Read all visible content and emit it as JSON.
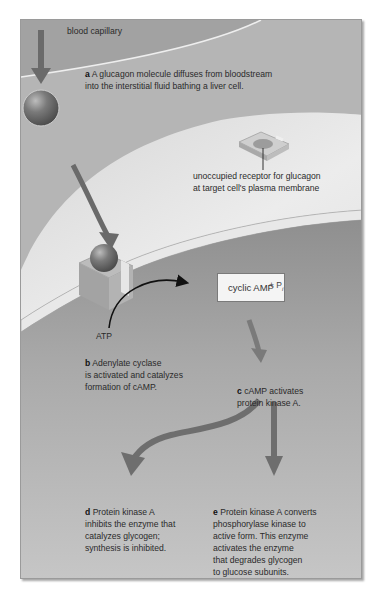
{
  "figure": {
    "type": "biology-signal-transduction-diagram",
    "colors": {
      "frame_bg": "#c9c9c9",
      "capillary": "#a8a8a8",
      "interstitial": "#b8b8b8",
      "cell_exterior_surface": "#e6e6e6",
      "cytoplasm": "#9e9e9e",
      "arrow": "#6e6e6e",
      "text": "#2a2a2a"
    }
  },
  "labels": {
    "blood_capillary": "blood capillary",
    "step_a": {
      "letter": "a",
      "text": "A glucagon molecule diffuses from bloodstream\ninto the interstitial fluid bathing a liver cell."
    },
    "receptor": "unoccupied receptor for glucagon\nat target cell's plasma membrane",
    "atp": "ATP",
    "cyclic_amp": "cyclic AMP",
    "pi_plus": "+ P",
    "pi_sub": "i",
    "step_b": {
      "letter": "b",
      "text": "Adenylate cyclase\nis activated and catalyzes\nformation of cAMP."
    },
    "step_c": {
      "letter": "c",
      "text": "cAMP activates\nprotein kinase A."
    },
    "step_d": {
      "letter": "d",
      "text": "Protein kinase A\ninhibits the enzyme that\ncatalyzes glycogen;\nsynthesis is inhibited."
    },
    "step_e": {
      "letter": "e",
      "text": "Protein kinase A converts\nphosphorylase kinase to\nactive form. This enzyme\nactivates the enzyme\nthat degrades glycogen\nto glucose subunits."
    }
  }
}
